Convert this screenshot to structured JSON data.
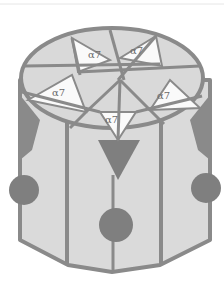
{
  "diagram": {
    "title": "",
    "subunit_label": "α7",
    "subunits": [
      {
        "id": 1,
        "label": "α7",
        "position": "top-left"
      },
      {
        "id": 2,
        "label": "α7",
        "position": "top-right"
      },
      {
        "id": 3,
        "label": "α7",
        "position": "left"
      },
      {
        "id": 4,
        "label": "α7",
        "position": "right"
      },
      {
        "id": 5,
        "label": "α7",
        "position": "bottom-center"
      }
    ],
    "colors": {
      "outline": "#8a8a8a",
      "facet_light": "#d9d9d9",
      "facet_white": "#fafafa",
      "body_fill": "#dadada",
      "dark_accent": "#7f7f7f",
      "background": "#ffffff"
    }
  }
}
